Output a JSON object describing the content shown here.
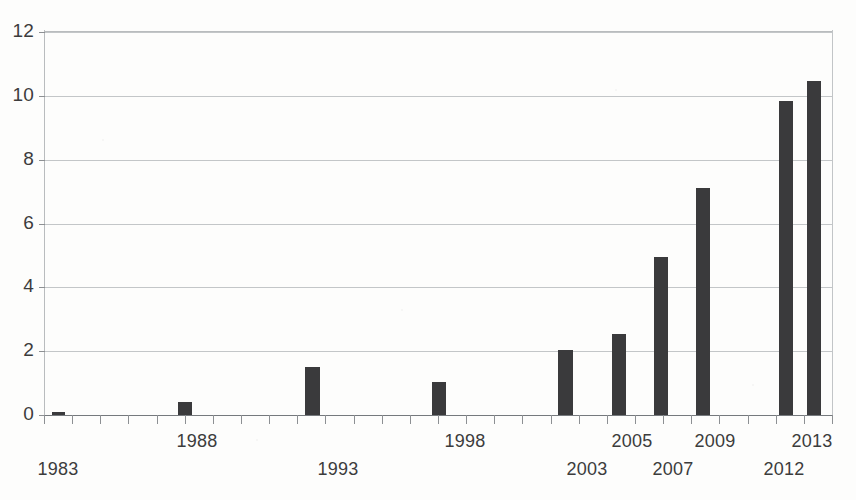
{
  "chart_data": {
    "type": "bar",
    "title": "",
    "subtitle": "",
    "xlabel": "",
    "ylabel": "",
    "categories": [
      "1983",
      "1988",
      "1993",
      "1998",
      "2003",
      "2005",
      "2007",
      "2009",
      "2012",
      "2013"
    ],
    "values": [
      0.1,
      0.4,
      1.5,
      1.05,
      2.05,
      2.55,
      4.95,
      7.1,
      9.85,
      10.45
    ],
    "series": [
      {
        "name": "",
        "values": [
          0.1,
          0.4,
          1.5,
          1.05,
          2.05,
          2.55,
          4.95,
          7.1,
          9.85,
          10.45
        ]
      }
    ],
    "ylim": [
      0,
      12
    ],
    "yticks": [
      0,
      2,
      4,
      6,
      8,
      10,
      12
    ],
    "ytick_labels": [
      "0",
      "2",
      "4",
      "6",
      "8",
      "10",
      "12"
    ],
    "xtick_labels": [
      "1983",
      "1988",
      "1993",
      "1998",
      "2003",
      "2005",
      "2007",
      "2009",
      "2012",
      "2013"
    ],
    "grid": true,
    "grid_axis": "y",
    "legend": false,
    "legend_position": "none",
    "bar_color": "#3a3a3c",
    "grid_color": "#b9bcbe",
    "axis_color": "#75797d",
    "text_color": "#3c3c3c",
    "background_color": "#fdfdfc",
    "annotations": []
  },
  "axes": {
    "y_ticks": [
      {
        "label": "12",
        "value": 12
      },
      {
        "label": "10",
        "value": 10
      },
      {
        "label": "8",
        "value": 8
      },
      {
        "label": "6",
        "value": 6
      },
      {
        "label": "4",
        "value": 4
      },
      {
        "label": "2",
        "value": 2
      },
      {
        "label": "0",
        "value": 0
      }
    ],
    "x_ticks": [
      {
        "label": "1983",
        "value": 0.1,
        "row": 1,
        "x_px": 58
      },
      {
        "label": "1988",
        "value": 0.4,
        "row": 0,
        "x_px": 197
      },
      {
        "label": "1993",
        "value": 1.5,
        "row": 1,
        "x_px": 338
      },
      {
        "label": "1998",
        "value": 1.05,
        "row": 0,
        "x_px": 465
      },
      {
        "label": "2003",
        "value": 2.05,
        "row": 1,
        "x_px": 587
      },
      {
        "label": "2005",
        "value": 2.55,
        "row": 0,
        "x_px": 632
      },
      {
        "label": "2007",
        "value": 4.95,
        "row": 1,
        "x_px": 673
      },
      {
        "label": "2009",
        "value": 7.1,
        "row": 0,
        "x_px": 715
      },
      {
        "label": "2012",
        "value": 9.85,
        "row": 1,
        "x_px": 784
      },
      {
        "label": "2013",
        "value": 10.45,
        "row": 0,
        "x_px": 812
      }
    ],
    "minor_tick_count": 28
  },
  "bars": [
    {
      "name": "bar-1983",
      "label": "1983",
      "value": 0.1,
      "x_px": 52,
      "width_px": 13
    },
    {
      "name": "bar-1988",
      "label": "1988",
      "value": 0.4,
      "x_px": 178,
      "width_px": 14
    },
    {
      "name": "bar-1993",
      "label": "1993",
      "value": 1.5,
      "x_px": 305,
      "width_px": 15
    },
    {
      "name": "bar-1998",
      "label": "1998",
      "value": 1.05,
      "x_px": 432,
      "width_px": 14
    },
    {
      "name": "bar-2003",
      "label": "2003",
      "value": 2.05,
      "x_px": 558,
      "width_px": 15
    },
    {
      "name": "bar-2005",
      "label": "2005",
      "value": 2.55,
      "x_px": 612,
      "width_px": 14
    },
    {
      "name": "bar-2007",
      "label": "2007",
      "value": 4.95,
      "x_px": 654,
      "width_px": 14
    },
    {
      "name": "bar-2009",
      "label": "2009",
      "value": 7.1,
      "x_px": 696,
      "width_px": 14
    },
    {
      "name": "bar-2012",
      "label": "2012",
      "value": 9.85,
      "x_px": 779,
      "width_px": 14
    },
    {
      "name": "bar-2013",
      "label": "2013",
      "value": 10.45,
      "x_px": 807,
      "width_px": 14
    }
  ]
}
